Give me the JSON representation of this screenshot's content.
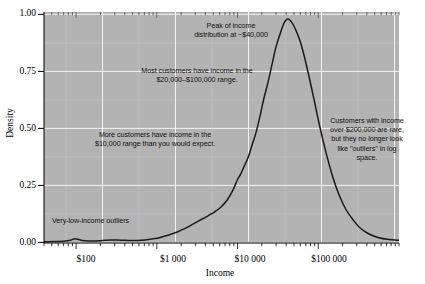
{
  "chart_data": {
    "type": "line",
    "title": "",
    "subtitle": "",
    "xlabel": "Income",
    "ylabel": "Density",
    "xscale": "log",
    "yscale": "linear",
    "ylim": [
      0,
      1.0
    ],
    "xlim": [
      40,
      1000000
    ],
    "grid": true,
    "legend": "none",
    "background_color": "#b3b3b3",
    "line_color": "#1a1a1a",
    "gridline_color": "#f2f2f2",
    "y_ticks": [
      "0.00",
      "0.25",
      "0.50",
      "0.75",
      "1.00"
    ],
    "y_tick_values": [
      0.0,
      0.25,
      0.5,
      0.75,
      1.0
    ],
    "x_ticks": [
      "$100",
      "$1 000",
      "$10 000",
      "$100 000"
    ],
    "x_tick_values": [
      100,
      1000,
      10000,
      100000
    ],
    "series": [
      {
        "name": "income density",
        "x": [
          40,
          55,
          70,
          85,
          95,
          105,
          120,
          140,
          165,
          195,
          230,
          270,
          320,
          380,
          450,
          540,
          640,
          760,
          900,
          1100,
          1300,
          1550,
          1850,
          2200,
          2600,
          3100,
          3700,
          4400,
          5200,
          6200,
          7400,
          8800,
          10000,
          11000,
          12000,
          13500,
          15000,
          17000,
          19000,
          21000,
          24000,
          27000,
          30000,
          34000,
          38000,
          42000,
          47000,
          53000,
          60000,
          68000,
          78000,
          90000,
          105000,
          125000,
          150000,
          180000,
          220000,
          270000,
          330000,
          420000,
          550000,
          750000,
          1000000
        ],
        "y": [
          0.005,
          0.006,
          0.008,
          0.012,
          0.018,
          0.016,
          0.011,
          0.009,
          0.009,
          0.01,
          0.012,
          0.013,
          0.013,
          0.012,
          0.011,
          0.011,
          0.012,
          0.014,
          0.018,
          0.024,
          0.031,
          0.04,
          0.05,
          0.062,
          0.075,
          0.09,
          0.105,
          0.12,
          0.135,
          0.155,
          0.185,
          0.23,
          0.275,
          0.3,
          0.33,
          0.37,
          0.42,
          0.48,
          0.55,
          0.62,
          0.7,
          0.78,
          0.85,
          0.91,
          0.955,
          0.97,
          0.955,
          0.92,
          0.87,
          0.8,
          0.71,
          0.61,
          0.5,
          0.39,
          0.29,
          0.21,
          0.145,
          0.1,
          0.065,
          0.04,
          0.024,
          0.015,
          0.012
        ]
      }
    ],
    "annotations": [
      {
        "name": "peak-annotation",
        "text": "Peak of income\ndistribution at ~$40,000"
      },
      {
        "name": "most-customers-annotation",
        "text": "Most customers have income in the\n$20,000–$100,000 range."
      },
      {
        "name": "more-customers-annotation",
        "text": "More customers have income in the\n$10,000 range than you would expect."
      },
      {
        "name": "high-income-annotation",
        "text": "Customers with income\nover $200,000 are rare,\nbut they no longer look\nlike \"outliers\" in log\nspace."
      },
      {
        "name": "low-income-annotation",
        "text": "Very-low-income outliers"
      }
    ]
  },
  "axes": {
    "y_title": "Density",
    "x_title": "Income",
    "y_tick_labels": [
      "0.00",
      "0.25",
      "0.50",
      "0.75",
      "1.00"
    ],
    "x_tick_labels": [
      "$100",
      "$1 000",
      "$10 000",
      "$100 000"
    ]
  },
  "annotations": {
    "peak": "Peak of income\ndistribution at ~$40,000",
    "most_customers": "Most customers have income in the\n$20,000–$100,000 range.",
    "more_customers": "More customers have income in the\n$10,000 range than you would expect.",
    "high_income": "Customers with income\nover $200,000 are rare,\nbut they no longer look\nlike \"outliers\" in log\nspace.",
    "low_income": "Very-low-income outliers"
  },
  "colors": {
    "plot_background": "#b3b3b3",
    "curve": "#1a1a1a",
    "gridlines": "#f2f2f2",
    "text": "#000000"
  }
}
